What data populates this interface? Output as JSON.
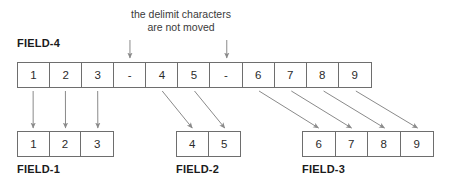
{
  "caption": {
    "line1": "the delimit characters",
    "line2": "are not moved"
  },
  "source": {
    "label": "FIELD-4",
    "cells": [
      "1",
      "2",
      "3",
      "-",
      "4",
      "5",
      "-",
      "6",
      "7",
      "8",
      "9"
    ],
    "delimiter_indices": [
      3,
      6
    ]
  },
  "targets": [
    {
      "label": "FIELD-1",
      "cells": [
        "1",
        "2",
        "3"
      ],
      "source_indices": [
        0,
        1,
        2
      ],
      "arrow_style": "vertical"
    },
    {
      "label": "FIELD-2",
      "cells": [
        "4",
        "5"
      ],
      "source_indices": [
        4,
        5
      ],
      "arrow_style": "diagonal"
    },
    {
      "label": "FIELD-3",
      "cells": [
        "6",
        "7",
        "8",
        "9"
      ],
      "source_indices": [
        7,
        8,
        9,
        10
      ],
      "arrow_style": "diagonal"
    }
  ],
  "colors": {
    "box_border": "#6e6e6e",
    "arrow": "#8a8a8a",
    "text": "#2b2b2b",
    "label_text": "#1b1b1b",
    "caption_text": "#3a3a3a",
    "background": "#ffffff"
  }
}
